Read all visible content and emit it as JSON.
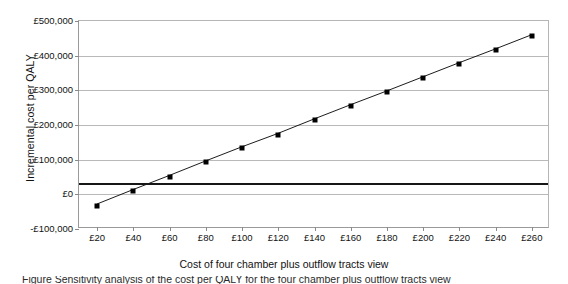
{
  "chart_data": {
    "type": "line",
    "title": "",
    "xlabel": "Cost of four chamber plus outflow tracts view",
    "ylabel": "Incremental cost per QALY",
    "x": [
      20,
      40,
      60,
      80,
      100,
      120,
      140,
      160,
      180,
      200,
      220,
      240,
      260
    ],
    "values": [
      -33000,
      9000,
      50000,
      92000,
      133000,
      172000,
      214000,
      255000,
      295000,
      336000,
      377000,
      417000,
      458000
    ],
    "series": [
      {
        "name": "Incremental cost per QALY",
        "values": [
          -33000,
          9000,
          50000,
          92000,
          133000,
          172000,
          214000,
          255000,
          295000,
          336000,
          377000,
          417000,
          458000
        ],
        "marker": "square",
        "color": "#000000"
      },
      {
        "name": "Cost-effectiveness threshold",
        "type": "hline",
        "value": 30000,
        "color": "#171717"
      }
    ],
    "x_tick_labels": [
      "£20",
      "£40",
      "£60",
      "£80",
      "£100",
      "£120",
      "£140",
      "£160",
      "£180",
      "£200",
      "£220",
      "£240",
      "£260"
    ],
    "x_tick_values": [
      20,
      40,
      60,
      80,
      100,
      120,
      140,
      160,
      180,
      200,
      220,
      240,
      260
    ],
    "y_tick_labels": [
      "£500,000",
      "£400,000",
      "£300,000",
      "£200,000",
      "£100,000",
      "£0",
      "-£100,000"
    ],
    "y_tick_values": [
      500000,
      400000,
      300000,
      200000,
      100000,
      0,
      -100000
    ],
    "xlim": [
      10,
      270
    ],
    "ylim": [
      -100000,
      500000
    ],
    "grid": "horizontal",
    "legend": "none",
    "threshold_line_value": 30000
  },
  "axes": {
    "y_title": "Incremental cost per QALY",
    "x_title": "Cost of four chamber plus outflow tracts view"
  },
  "caption": {
    "clipped_line": "Figure  Sensitivity analysis of the cost per QALY for the four chamber plus outflow tracts view"
  },
  "colors": {
    "series": "#000000",
    "threshold": "#171717",
    "gridline": "#b9b9b9",
    "axis": "#9a9a9a",
    "background": "#ffffff",
    "text": "#121212"
  }
}
